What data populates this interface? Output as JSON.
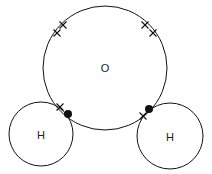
{
  "stroke_color": "#111111",
  "atoms": [
    {
      "id": "oxygen",
      "label": "O",
      "cx": 105,
      "cy": 68,
      "r": 62
    },
    {
      "id": "hydrogen-left",
      "label": "H",
      "cx": 41,
      "cy": 134,
      "r": 32
    },
    {
      "id": "hydrogen-right",
      "label": "H",
      "cx": 170,
      "cy": 136,
      "r": 33
    }
  ],
  "lone_pair_crosses": [
    {
      "x": 63,
      "y": 25
    },
    {
      "x": 57,
      "y": 33
    },
    {
      "x": 145,
      "y": 25
    },
    {
      "x": 153,
      "y": 33
    }
  ],
  "bonding_pairs": [
    {
      "cross": {
        "x": 60,
        "y": 107
      },
      "dot": {
        "x": 68,
        "y": 114
      }
    },
    {
      "cross": {
        "x": 143,
        "y": 116
      },
      "dot": {
        "x": 149,
        "y": 109
      }
    }
  ]
}
